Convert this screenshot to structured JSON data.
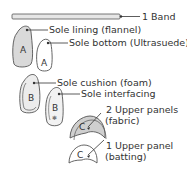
{
  "diagram": {
    "title": "",
    "pieces": [
      {
        "id": "band",
        "label": "1 Band",
        "letter": ""
      },
      {
        "id": "sole-lining",
        "label": "Sole lining (flannel)",
        "letter": "A"
      },
      {
        "id": "sole-bottom",
        "label": "Sole bottom (Ultrasuede)",
        "letter": "A"
      },
      {
        "id": "sole-cushion",
        "label": "Sole cushion (foam)",
        "letter": "B"
      },
      {
        "id": "sole-interfacing",
        "label": "Sole interfacing",
        "letter": "B"
      },
      {
        "id": "upper-panels-fabric",
        "label_line1": "2 Upper panels",
        "label_line2": "(fabric)",
        "letter": "C"
      },
      {
        "id": "upper-panel-batting",
        "label_line1": "1 Upper panel",
        "label_line2": "(batting)",
        "letter": "C"
      }
    ],
    "colors": {
      "outline": "#555555",
      "fill_gray": "#d9d9d9",
      "fill_white": "#ffffff",
      "text": "#333333"
    }
  }
}
